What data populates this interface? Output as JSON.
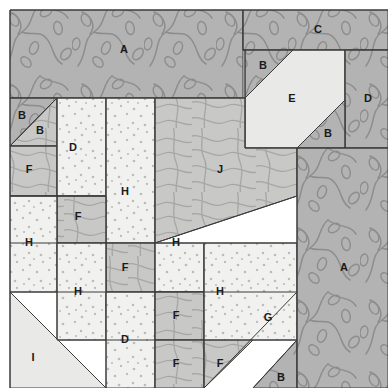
{
  "diagram": {
    "kind": "quilt-block-patch-layout",
    "canvas": {
      "width": 388,
      "height": 388
    },
    "block_bounds": {
      "x": 10,
      "y": 10,
      "width": 378,
      "height": 378
    },
    "fabrics": [
      {
        "id": "vine",
        "name": "dark-gray-vine-print",
        "fill": "#b2b2b2",
        "motif": "#8e8e8e"
      },
      {
        "id": "contour",
        "name": "medium-gray-contour-print",
        "fill": "#c7c7c7",
        "motif": "#a3a3a3"
      },
      {
        "id": "dot",
        "name": "light-dotted-print",
        "fill": "#f0f0ee",
        "motif": "#b9b9b9"
      },
      {
        "id": "plain",
        "name": "light-solid",
        "fill": "#e8e8e6",
        "motif": "#cccccc"
      }
    ],
    "seam_color": "#3a3a3a",
    "label_color": "#1a1a1a",
    "patches": [
      {
        "name": "patch-A-top",
        "label": "A",
        "fabric": "vine",
        "label_x": 124,
        "label_y": 50,
        "points": "10,10 243,10 243,98 10,98"
      },
      {
        "name": "patch-C",
        "label": "C",
        "fabric": "vine",
        "label_x": 318,
        "label_y": 30,
        "points": "243,10 388,10 388,50 243,50"
      },
      {
        "name": "patch-B-upper-right",
        "label": "B",
        "fabric": "vine",
        "label_x": 263,
        "label_y": 66,
        "points": "243,50 293,50 245,98 245,50"
      },
      {
        "name": "patch-E",
        "label": "E",
        "fabric": "plain",
        "label_x": 292,
        "label_y": 99,
        "points": "293,50 345,50 345,100 297,148 245,148 245,98"
      },
      {
        "name": "patch-D-right",
        "label": "D",
        "fabric": "vine",
        "label_x": 368,
        "label_y": 99,
        "points": "345,50 388,50 388,148 345,148 345,100"
      },
      {
        "name": "patch-B-mid-right",
        "label": "B",
        "fabric": "vine",
        "label_x": 328,
        "label_y": 134,
        "points": "345,100 345,148 297,148"
      },
      {
        "name": "patch-B-left-upper",
        "label": "B",
        "fabric": "vine",
        "label_x": 22,
        "label_y": 116,
        "points": "10,98 57,98 10,146"
      },
      {
        "name": "patch-B-left-lower",
        "label": "B",
        "fabric": "contour",
        "label_x": 40,
        "label_y": 131,
        "points": "57,98 57,146 10,146"
      },
      {
        "name": "patch-F-left",
        "label": "F",
        "fabric": "contour",
        "label_x": 29,
        "label_y": 170,
        "points": "10,146 57,146 57,196 10,196"
      },
      {
        "name": "patch-D-upper-mid",
        "label": "D",
        "fabric": "dot",
        "label_x": 73,
        "label_y": 148,
        "points": "57,98 106,98 106,196 57,196"
      },
      {
        "name": "patch-H-upper",
        "label": "H",
        "fabric": "dot",
        "label_x": 125,
        "label_y": 192,
        "points": "106,98 155,98 155,243 106,243"
      },
      {
        "name": "patch-J",
        "label": "J",
        "fabric": "contour",
        "label_x": 220,
        "label_y": 170,
        "points": "155,98 245,98 245,148 297,148 297,196 155,243"
      },
      {
        "name": "patch-F-upper-mid",
        "label": "F",
        "fabric": "contour",
        "label_x": 78,
        "label_y": 217,
        "points": "57,196 106,196 106,243 57,243"
      },
      {
        "name": "patch-H-left",
        "label": "H",
        "fabric": "dot",
        "label_x": 29,
        "label_y": 243,
        "points": "10,196 57,196 57,292 10,292"
      },
      {
        "name": "patch-F-center",
        "label": "F",
        "fabric": "contour",
        "label_x": 125,
        "label_y": 268,
        "points": "106,243 155,243 155,292 106,292"
      },
      {
        "name": "patch-H-center",
        "label": "H",
        "fabric": "dot",
        "label_x": 78,
        "label_y": 292,
        "points": "57,243 106,243 106,340 57,340"
      },
      {
        "name": "patch-H-right",
        "label": "H",
        "fabric": "dot",
        "label_x": 176,
        "label_y": 243,
        "points": "155,243 204,243 204,292 155,292"
      },
      {
        "name": "patch-H-lower-right",
        "label": "H",
        "fabric": "dot",
        "label_x": 220,
        "label_y": 292,
        "points": "155,292 204,292 204,340 155,340"
      },
      {
        "name": "patch-D-lower",
        "label": "D",
        "fabric": "dot",
        "label_x": 125,
        "label_y": 340,
        "points": "106,292 155,292 155,388 106,388"
      },
      {
        "name": "patch-F-lower-right",
        "label": "F",
        "fabric": "contour",
        "label_x": 176,
        "label_y": 316,
        "points": "155,292 204,292 204,340 155,340"
      },
      {
        "name": "patch-G",
        "label": "G",
        "fabric": "dot",
        "label_x": 268,
        "label_y": 318,
        "points": "204,243 297,243 297,340 253,340 204,388"
      },
      {
        "name": "patch-B-bottom",
        "label": "B",
        "fabric": "vine",
        "label_x": 281,
        "label_y": 378,
        "points": "297,340 297,388 253,388"
      },
      {
        "name": "patch-A-right",
        "label": "A",
        "fabric": "vine",
        "label_x": 344,
        "label_y": 268,
        "points": "297,148 388,148 388,388 297,388"
      },
      {
        "name": "patch-I",
        "label": "I",
        "fabric": "plain",
        "label_x": 33,
        "label_y": 358,
        "points": "10,292 106,388 10,388"
      },
      {
        "name": "patch-F-bottom-1",
        "label": "F",
        "fabric": "contour",
        "label_x": 176,
        "label_y": 364,
        "points": "155,340 204,340 204,388 155,388"
      },
      {
        "name": "patch-F-bottom-2",
        "label": "F",
        "fabric": "contour",
        "label_x": 220,
        "label_y": 364,
        "points": "204,340 253,340 204,388"
      }
    ],
    "seam_lines": [
      {
        "name": "seam-block-top",
        "x1": 10,
        "y1": 10,
        "x2": 388,
        "y2": 10
      },
      {
        "name": "seam-block-left",
        "x1": 10,
        "y1": 10,
        "x2": 10,
        "y2": 388
      },
      {
        "name": "seam-row-a-bottom",
        "x1": 10,
        "y1": 98,
        "x2": 245,
        "y2": 98
      },
      {
        "name": "seam-col-c-left",
        "x1": 243,
        "y1": 10,
        "x2": 243,
        "y2": 50
      },
      {
        "name": "seam-row-c-bottom",
        "x1": 243,
        "y1": 50,
        "x2": 388,
        "y2": 50
      },
      {
        "name": "seam-e-left",
        "x1": 245,
        "y1": 50,
        "x2": 245,
        "y2": 148
      },
      {
        "name": "seam-e-right",
        "x1": 345,
        "y1": 50,
        "x2": 345,
        "y2": 148
      },
      {
        "name": "seam-e-bottom",
        "x1": 245,
        "y1": 148,
        "x2": 388,
        "y2": 148
      },
      {
        "name": "seam-e-diag-topleft",
        "x1": 245,
        "y1": 98,
        "x2": 293,
        "y2": 50
      },
      {
        "name": "seam-e-diag-botright",
        "x1": 297,
        "y1": 148,
        "x2": 345,
        "y2": 100
      },
      {
        "name": "seam-left-b-diag",
        "x1": 10,
        "y1": 146,
        "x2": 57,
        "y2": 98
      },
      {
        "name": "seam-left-b-bottom",
        "x1": 10,
        "y1": 146,
        "x2": 57,
        "y2": 146
      },
      {
        "name": "seam-f-left-bottom",
        "x1": 10,
        "y1": 196,
        "x2": 106,
        "y2": 196
      },
      {
        "name": "seam-col-57",
        "x1": 57,
        "y1": 98,
        "x2": 57,
        "y2": 340
      },
      {
        "name": "seam-col-106",
        "x1": 106,
        "y1": 98,
        "x2": 106,
        "y2": 388
      },
      {
        "name": "seam-col-155",
        "x1": 155,
        "y1": 98,
        "x2": 155,
        "y2": 388
      },
      {
        "name": "seam-col-204",
        "x1": 204,
        "y1": 243,
        "x2": 204,
        "y2": 388
      },
      {
        "name": "seam-col-297",
        "x1": 297,
        "y1": 148,
        "x2": 297,
        "y2": 388
      },
      {
        "name": "seam-j-diag",
        "x1": 155,
        "y1": 243,
        "x2": 297,
        "y2": 196
      },
      {
        "name": "seam-row-243",
        "x1": 10,
        "y1": 243,
        "x2": 297,
        "y2": 243
      },
      {
        "name": "seam-row-196-mid",
        "x1": 10,
        "y1": 196,
        "x2": 106,
        "y2": 196
      },
      {
        "name": "seam-row-292",
        "x1": 10,
        "y1": 292,
        "x2": 297,
        "y2": 292
      },
      {
        "name": "seam-row-340",
        "x1": 57,
        "y1": 340,
        "x2": 297,
        "y2": 340
      },
      {
        "name": "seam-i-diag",
        "x1": 10,
        "y1": 292,
        "x2": 106,
        "y2": 388
      },
      {
        "name": "seam-g-diag",
        "x1": 204,
        "y1": 388,
        "x2": 297,
        "y2": 292
      },
      {
        "name": "seam-b-bottom-diag",
        "x1": 253,
        "y1": 388,
        "x2": 297,
        "y2": 340
      }
    ],
    "legend_labels": [
      "A",
      "B",
      "C",
      "D",
      "E",
      "F",
      "G",
      "H",
      "I",
      "J"
    ]
  }
}
